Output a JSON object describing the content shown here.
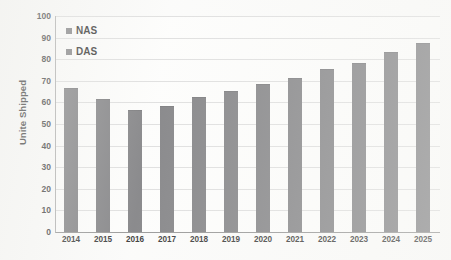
{
  "chart_data": {
    "type": "bar",
    "title": "",
    "subtitle": "",
    "xlabel": "",
    "ylabel": "Unite Shipped",
    "categories": [
      "2014",
      "2015",
      "2016",
      "2017",
      "2018",
      "2019",
      "2020",
      "2021",
      "2022",
      "2023",
      "2024",
      "2025"
    ],
    "values": [
      66,
      61,
      56,
      58,
      62,
      65,
      68,
      71,
      75,
      78,
      83,
      87
    ],
    "series": [
      {
        "name": "NAS",
        "values": [
          66,
          61,
          56,
          58,
          62,
          65,
          68,
          71,
          75,
          78,
          83,
          87
        ]
      }
    ],
    "ylim": [
      0,
      100
    ],
    "yticks": [
      0,
      10,
      20,
      30,
      40,
      50,
      60,
      70,
      80,
      90,
      100
    ],
    "ytick_labels": [
      "0",
      "10",
      "20",
      "30",
      "40",
      "50",
      "60",
      "70",
      "80",
      "90",
      "100"
    ],
    "grid": true,
    "legend_position": "top-left",
    "legend": [
      {
        "label": "NAS",
        "color": "#77777a"
      },
      {
        "label": "DAS",
        "color": "#77777a"
      }
    ],
    "bar_color": "#77777a",
    "background_color": "#fbfbfa",
    "gridline_color": "#dcdcdc",
    "axis_color": "#8c8c8c"
  }
}
